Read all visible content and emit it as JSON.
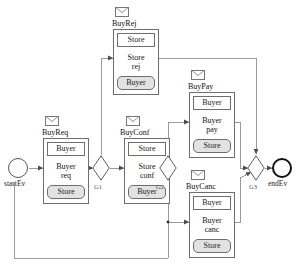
{
  "diagram": {
    "type": "bpmn-choreography",
    "colors": {
      "stroke": "#6e6e6e",
      "edge": "#8a8a8a",
      "band_fill": "#e2e2e2",
      "task_fill": "#ffffff",
      "end_event_stroke": "#111111"
    }
  },
  "events": {
    "start": {
      "label": "startEv",
      "icon": "circle-thin-icon"
    },
    "end": {
      "label": "endEv",
      "icon": "circle-thick-icon"
    }
  },
  "gateways": [
    {
      "id": "G1",
      "label": "G1",
      "icon": "diamond-gateway-icon"
    },
    {
      "id": "G2",
      "label": "G2",
      "icon": "diamond-gateway-icon"
    },
    {
      "id": "G3",
      "label": "G3",
      "icon": "diamond-gateway-icon"
    }
  ],
  "tasks": [
    {
      "id": "BuyReq",
      "name": "BuyReq",
      "message_icon": "envelope-icon",
      "initiator": "Buyer",
      "activity": "Buyer req",
      "activity_lines": [
        "Buyer",
        "req"
      ],
      "receiver": "Store"
    },
    {
      "id": "BuyRej",
      "name": "BuyRej",
      "message_icon": "envelope-icon",
      "initiator": "Store",
      "activity": "Store rej",
      "activity_lines": [
        "Store",
        "rej"
      ],
      "receiver": "Buyer"
    },
    {
      "id": "BuyConf",
      "name": "BuyConf",
      "message_icon": "envelope-icon",
      "initiator": "Store",
      "activity": "Store conf",
      "activity_lines": [
        "Store",
        "conf"
      ],
      "receiver": "Buyer"
    },
    {
      "id": "BuyPay",
      "name": "BuyPay",
      "message_icon": "envelope-icon",
      "initiator": "Buyer",
      "activity": "Buyer pay",
      "activity_lines": [
        "Buyer",
        "pay"
      ],
      "receiver": "Store"
    },
    {
      "id": "BuyCanc",
      "name": "BuyCanc",
      "message_icon": "envelope-icon",
      "initiator": "Buyer",
      "activity": "Buyer canc",
      "activity_lines": [
        "Buyer",
        "canc"
      ],
      "receiver": "Store"
    }
  ]
}
